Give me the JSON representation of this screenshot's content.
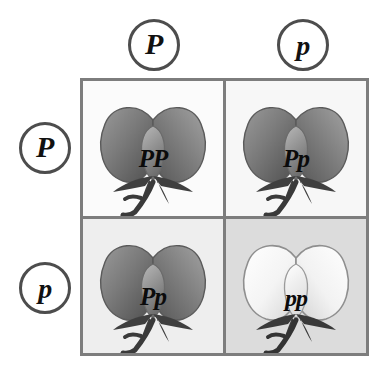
{
  "diagram": {
    "type": "punnett-square",
    "gene_symbol": "P",
    "columns": [
      {
        "allele": "P",
        "case": "dominant"
      },
      {
        "allele": "p",
        "case": "recessive"
      }
    ],
    "rows": [
      {
        "allele": "P",
        "case": "dominant"
      },
      {
        "allele": "p",
        "case": "recessive"
      }
    ],
    "cells": [
      {
        "row": 0,
        "col": 0,
        "genotype": "PP",
        "phenotype": "purple-flower",
        "flower_shade": "dark",
        "cell_background": "#fbfbfb",
        "icon": "pea-flower-icon"
      },
      {
        "row": 0,
        "col": 1,
        "genotype": "Pp",
        "phenotype": "purple-flower",
        "flower_shade": "dark",
        "cell_background": "#f7f7f7",
        "icon": "pea-flower-icon"
      },
      {
        "row": 1,
        "col": 0,
        "genotype": "Pp",
        "phenotype": "purple-flower",
        "flower_shade": "dark",
        "cell_background": "#eeeeee",
        "icon": "pea-flower-icon"
      },
      {
        "row": 1,
        "col": 1,
        "genotype": "pp",
        "phenotype": "white-flower",
        "flower_shade": "light",
        "cell_background": "#dcdcdc",
        "icon": "pea-flower-icon"
      }
    ],
    "colors": {
      "grid_border": "#7d7d7d",
      "circle_border": "#4d4d4d",
      "text": "#111111",
      "flower_dark": "#6f6f6f",
      "flower_light": "#f2f2f2",
      "stem": "#3a3a3a",
      "page_background": "#ffffff"
    }
  }
}
